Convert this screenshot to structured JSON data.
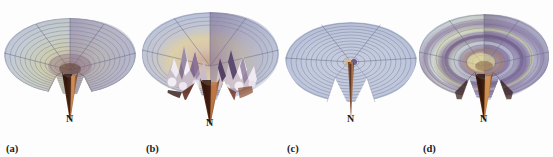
{
  "figure": {
    "background_color": "#fdfdfd",
    "panel_count": 4,
    "axis_label": "N"
  },
  "panels": [
    {
      "id": "a",
      "caption": "(a)",
      "spike_label": "N",
      "surface": "smooth funnel, monotone decreasing toward centre",
      "rim_color": "#b9c2d8",
      "mid_color": "#c8cfe0",
      "highlight_color": "#d7d79a",
      "shadow_color": "#8a7fa6",
      "spike_color": "#3a1d12",
      "spike_highlight": "#c07a45",
      "grid_color": "#6e6e86",
      "ring_count": 13,
      "radial_count": 5,
      "wedge_gap_deg": 60
    },
    {
      "id": "b",
      "caption": "(b)",
      "spike_label": "N",
      "surface": "highly oscillatory jagged funnel with interior peaks and troughs",
      "rim_color": "#bcc5da",
      "mid_color": "#d3c3bc",
      "highlight_color": "#e8d29a",
      "shadow_color": "#54406a",
      "spike_color": "#4a1f14",
      "spike_highlight": "#b06a3e",
      "grid_color": "#6e6e86",
      "ring_count": 9,
      "radial_count": 5,
      "wedge_gap_deg": 60
    },
    {
      "id": "c",
      "caption": "(c)",
      "spike_label": "N",
      "surface": "nearly flat disk with faint concentric rings and a single thin needle spike",
      "rim_color": "#b7c0d6",
      "mid_color": "#c2cada",
      "highlight_color": "#ced5e2",
      "shadow_color": "#9aa3bb",
      "spike_color": "#6a3a22",
      "spike_highlight": "#b98a5e",
      "grid_color": "#77778e",
      "ring_count": 12,
      "radial_count": 3,
      "wedge_gap_deg": 60
    },
    {
      "id": "d",
      "caption": "(d)",
      "spike_label": "N",
      "surface": "concentric wave ridges, banded purple / tan / yellow, with central spike",
      "rim_color": "#b8c1d7",
      "mid_color": "#7d6596",
      "highlight_color": "#e6e09a",
      "shadow_color": "#4e3a63",
      "spike_color": "#3d2014",
      "spike_highlight": "#c98a4e",
      "grid_color": "#6e6e86",
      "ring_count": 11,
      "radial_count": 5,
      "wedge_gap_deg": 55
    }
  ]
}
